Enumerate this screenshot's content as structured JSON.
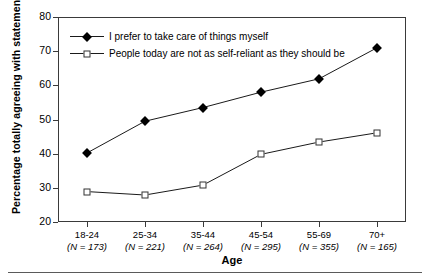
{
  "chart_data": {
    "type": "line",
    "title": "",
    "xlabel": "Age",
    "ylabel": "Percentage totally agreeing with statement",
    "categories": [
      "18-24",
      "25-34",
      "35-44",
      "45-54",
      "55-69",
      "70+"
    ],
    "category_sublabels": [
      "(N = 173)",
      "(N = 221)",
      "(N = 264)",
      "(N = 295)",
      "(N = 355)",
      "(N = 165)"
    ],
    "sample_sizes": [
      173,
      221,
      264,
      295,
      355,
      165
    ],
    "ylim": [
      20,
      80
    ],
    "yticks": [
      20,
      30,
      40,
      50,
      60,
      70,
      80
    ],
    "grid": false,
    "legend_position": "top-left inside plot",
    "series": [
      {
        "name": "I prefer to take care of things myself",
        "marker": "filled-diamond",
        "values": [
          40.2,
          49.5,
          53.5,
          58.0,
          61.9,
          71.0
        ]
      },
      {
        "name": "People today are not as self-reliant as they should be",
        "marker": "open-square",
        "values": [
          28.9,
          27.9,
          30.8,
          39.8,
          43.4,
          46.1
        ]
      }
    ]
  },
  "axis": {
    "ytick_labels": [
      "80",
      "70",
      "60",
      "50",
      "40",
      "30",
      "20"
    ],
    "x_title": "Age",
    "y_title": "Percentage totally agreeing with statement"
  },
  "legend": {
    "entries": [
      {
        "label": "I prefer to take care of things myself",
        "marker": "filled-diamond"
      },
      {
        "label": "People today are not as self-reliant as they should be",
        "marker": "open-square"
      }
    ]
  },
  "colors": {
    "line": "#1a1a1a",
    "axis": "#3a3a3a",
    "marker_fill": "#000000",
    "marker_open_fill": "#ffffff",
    "background": "#ffffff"
  }
}
